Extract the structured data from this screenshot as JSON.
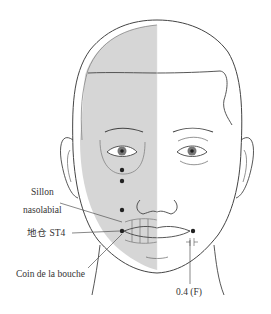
{
  "diagram": {
    "labels": {
      "sillon_line1": "Sillon",
      "sillon_line2": "nasolabial",
      "point_name": "地仓 ST4",
      "corner_mouth": "Coin de la bouche",
      "distance": "0.4 (F)"
    },
    "points": [
      {
        "name": "point-below-eye-1",
        "x": 122,
        "y": 170
      },
      {
        "name": "point-below-eye-2",
        "x": 122,
        "y": 181
      },
      {
        "name": "point-nasolabial",
        "x": 122,
        "y": 210
      },
      {
        "name": "point-st4-left",
        "x": 122,
        "y": 231
      },
      {
        "name": "point-st4-right",
        "x": 193,
        "y": 231
      }
    ],
    "colors": {
      "skull_shading": "#d6d6d6",
      "line": "#444444",
      "point": "#222222",
      "text": "#333333"
    }
  }
}
